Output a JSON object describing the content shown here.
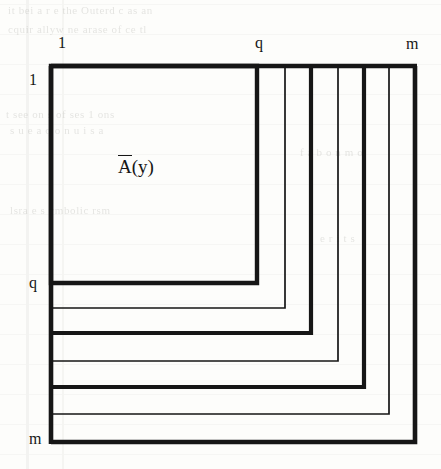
{
  "figure": {
    "name": "nested-staircase-matrix-diagram",
    "background_color": "#fdfdfb",
    "ink_color": "#161616",
    "region_label": {
      "overbar_char": "A",
      "rest": "(y)",
      "full": "Ā(y)",
      "x": 118,
      "y": 155
    },
    "column_labels": [
      {
        "text": "1",
        "x": 58,
        "y": 35
      },
      {
        "text": "q",
        "x": 255,
        "y": 35
      },
      {
        "text": "m",
        "x": 406,
        "y": 35
      }
    ],
    "row_labels": [
      {
        "text": "1",
        "x": 29,
        "y": 72
      },
      {
        "text": "q",
        "x": 29,
        "y": 275
      },
      {
        "text": "m",
        "x": 29,
        "y": 430
      }
    ],
    "origin": {
      "x": 51,
      "y": 66
    },
    "nested_corners": [
      {
        "index": 1,
        "x": 257,
        "y": 283,
        "weight": "thick",
        "stroke_width": 4.4
      },
      {
        "index": 2,
        "x": 285,
        "y": 308,
        "weight": "thin",
        "stroke_width": 1.7
      },
      {
        "index": 3,
        "x": 311,
        "y": 333,
        "weight": "thick",
        "stroke_width": 4.2
      },
      {
        "index": 4,
        "x": 338,
        "y": 361,
        "weight": "thin",
        "stroke_width": 1.7
      },
      {
        "index": 5,
        "x": 364,
        "y": 387,
        "weight": "thick",
        "stroke_width": 4.2
      },
      {
        "index": 6,
        "x": 389,
        "y": 414,
        "weight": "thin",
        "stroke_width": 1.7
      },
      {
        "index": 7,
        "x": 415,
        "y": 442,
        "weight": "thick",
        "stroke_width": 4.6
      }
    ],
    "page_show_through": [
      {
        "text": "it bei a r e the Outerd c as an",
        "x": 8,
        "y": 8
      },
      {
        "text": "cquir allyw ne arase of  ce tl",
        "x": 8,
        "y": 27
      },
      {
        "text": "t see on   s of  ses 1  ons",
        "x": 6,
        "y": 112
      },
      {
        "text": "s u e  a   q   o  n  u i  s  a",
        "x": 10,
        "y": 128
      },
      {
        "text": "lsra e   s ymbolic   rsm",
        "x": 10,
        "y": 208
      },
      {
        "text": "f  a  b   o  n     m    o",
        "x": 300,
        "y": 150
      },
      {
        "text": "e   r   i   t   s",
        "x": 320,
        "y": 236
      }
    ]
  }
}
